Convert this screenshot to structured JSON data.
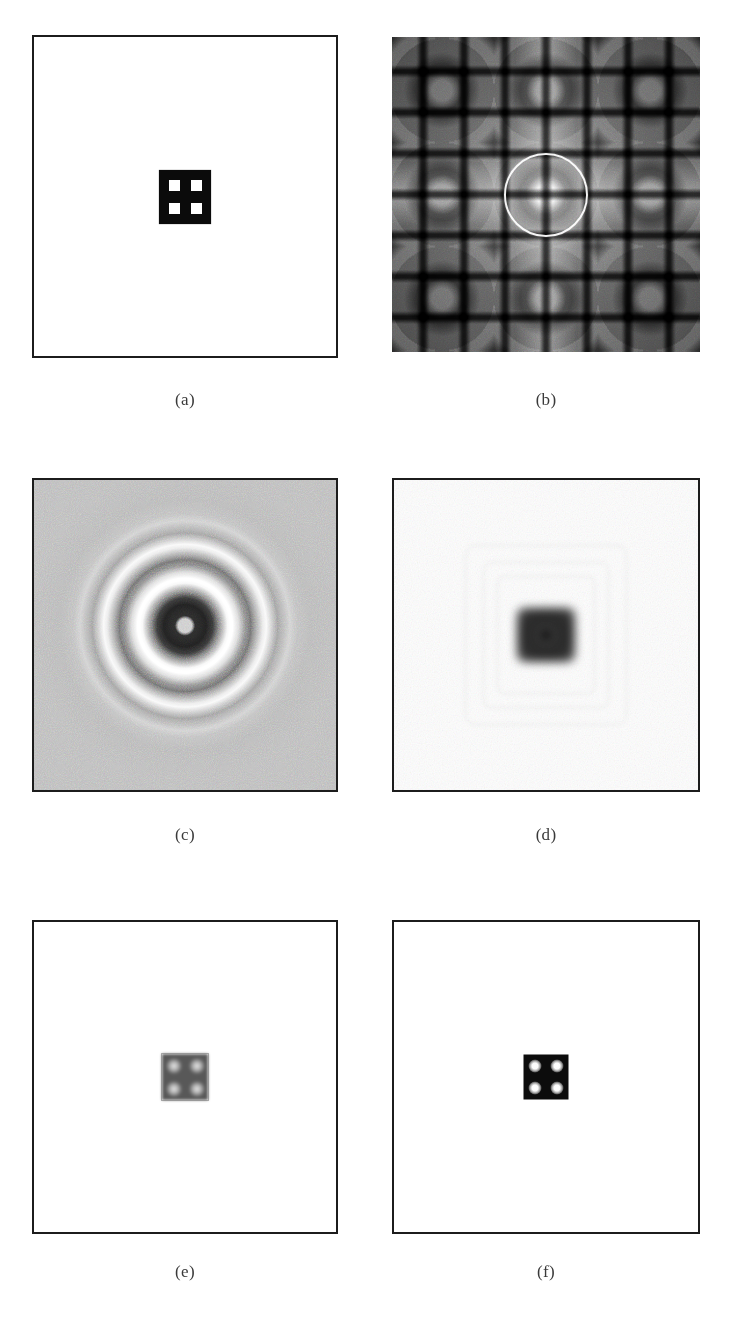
{
  "figure": {
    "kind": "multi-panel-image-figure",
    "panel_count": 6,
    "columns": 2,
    "rows": 3,
    "background_color": "#ffffff",
    "frame_color": "#1c1c1c",
    "caption_color": "#3a3a3a"
  },
  "panels": [
    {
      "id": "a",
      "caption": "(a)",
      "content": "binary-aperture-image",
      "description": "White field with a small centered black square containing a 2x2 grid of white square holes",
      "field_color": "#ffffff",
      "block_color": "#0b0b0b",
      "hole_color": "#ffffff",
      "hole_count": 4,
      "hole_layout": "2x2"
    },
    {
      "id": "b",
      "caption": "(b)",
      "content": "fourier-log-magnitude-spectrum",
      "description": "Grayscale log magnitude spectrum with periodic cross-shaped lobes, bright DC center and a white circular cutoff overlay",
      "overlay": "white-circle-cutoff",
      "overlay_color": "#ffffff",
      "background_color": "#6e6e6e"
    },
    {
      "id": "c",
      "caption": "(c)",
      "content": "ideal-lowpass-point-spread-function",
      "description": "Noisy mid-gray field with concentric bright and dark rings (ringing / Gibbs phenomenon) around a dark core",
      "background_color": "#b9b9b9",
      "ring_count": 4
    },
    {
      "id": "d",
      "caption": "(d)",
      "content": "blurred-square-with-ringing",
      "description": "Near-white field with a centered blurred dark square and faint ringing artifacts",
      "background_color": "#fefefe",
      "block_color": "#2a2a2a"
    },
    {
      "id": "e",
      "caption": "(e)",
      "content": "low-contrast-reconstruction",
      "description": "White field with a small blurred gray square containing four diffuse white blobs",
      "field_color": "#ffffff",
      "block_color": "#585858",
      "hole_count": 4,
      "hole_layout": "2x2"
    },
    {
      "id": "f",
      "caption": "(f)",
      "content": "high-contrast-reconstruction",
      "description": "White field with a small black square containing four sharp white circular blobs",
      "field_color": "#ffffff",
      "block_color": "#0c0c0c",
      "hole_count": 4,
      "hole_layout": "2x2"
    }
  ]
}
